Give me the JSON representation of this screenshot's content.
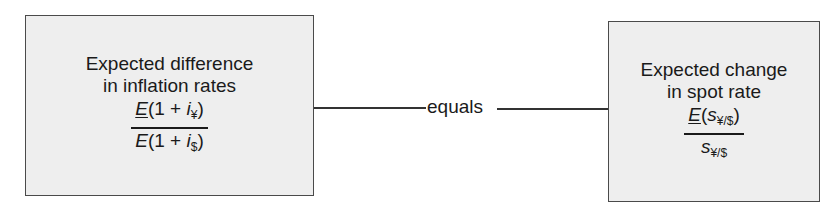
{
  "left_box": {
    "label_line1": "Expected difference",
    "label_line2": "in inflation rates",
    "formula": {
      "numerator": {
        "E": "E",
        "open": "(1 + ",
        "var": "i",
        "sub": "¥",
        "close": ")"
      },
      "denominator": {
        "E": "E",
        "open": "(1 + ",
        "var": "i",
        "sub": "$",
        "close": ")"
      }
    }
  },
  "connector": {
    "label": "equals"
  },
  "right_box": {
    "label_line1": "Expected change",
    "label_line2": "in spot rate",
    "formula": {
      "numerator": {
        "E": "E",
        "open": "(",
        "var": "s",
        "sub": "¥/$",
        "close": ")"
      },
      "denominator": {
        "var": "s",
        "sub": "¥/$"
      }
    }
  }
}
